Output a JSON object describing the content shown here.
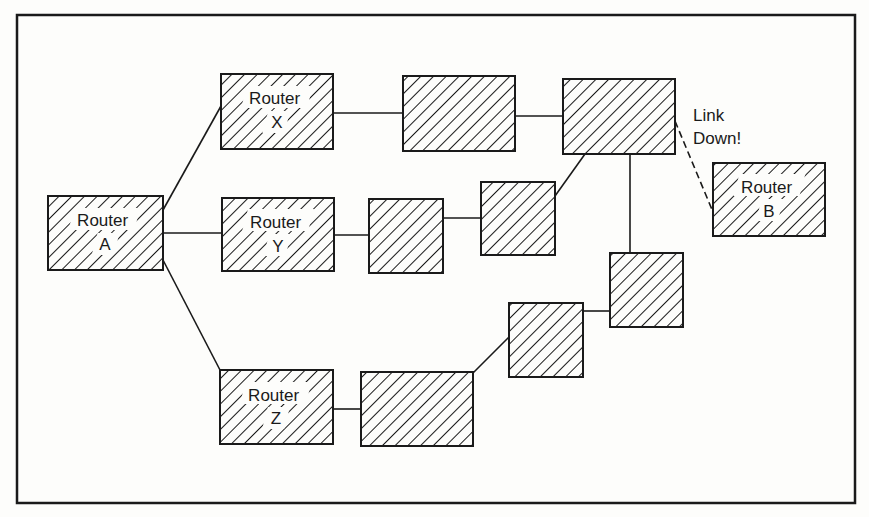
{
  "diagram": {
    "title": "",
    "nodes": [
      {
        "id": "router-a",
        "lines": [
          "Router",
          "A"
        ]
      },
      {
        "id": "router-x",
        "lines": [
          "Router",
          "X"
        ]
      },
      {
        "id": "router-y",
        "lines": [
          "Router",
          "Y"
        ]
      },
      {
        "id": "router-z",
        "lines": [
          "Router",
          "Z"
        ]
      },
      {
        "id": "router-b",
        "lines": [
          "Router",
          "B"
        ]
      },
      {
        "id": "node-x2",
        "lines": []
      },
      {
        "id": "node-hub",
        "lines": []
      },
      {
        "id": "node-y2",
        "lines": []
      },
      {
        "id": "node-y3",
        "lines": []
      },
      {
        "id": "node-z2",
        "lines": []
      },
      {
        "id": "node-z3",
        "lines": []
      },
      {
        "id": "node-z4",
        "lines": []
      }
    ],
    "links": [
      {
        "from": "router-a",
        "to": "router-x",
        "style": "solid"
      },
      {
        "from": "router-a",
        "to": "router-y",
        "style": "solid"
      },
      {
        "from": "router-a",
        "to": "router-z",
        "style": "solid"
      },
      {
        "from": "router-x",
        "to": "node-x2",
        "style": "solid"
      },
      {
        "from": "node-x2",
        "to": "node-hub",
        "style": "solid"
      },
      {
        "from": "router-y",
        "to": "node-y2",
        "style": "solid"
      },
      {
        "from": "node-y2",
        "to": "node-y3",
        "style": "solid"
      },
      {
        "from": "node-y3",
        "to": "node-hub",
        "style": "solid"
      },
      {
        "from": "router-z",
        "to": "node-z2",
        "style": "solid"
      },
      {
        "from": "node-z2",
        "to": "node-z3",
        "style": "solid"
      },
      {
        "from": "node-z3",
        "to": "node-z4",
        "style": "solid"
      },
      {
        "from": "node-z4",
        "to": "node-hub",
        "style": "solid"
      },
      {
        "from": "node-hub",
        "to": "router-b",
        "style": "dashed",
        "status": "down"
      }
    ],
    "annotation": {
      "lines": [
        "Link",
        "Down!"
      ]
    }
  }
}
